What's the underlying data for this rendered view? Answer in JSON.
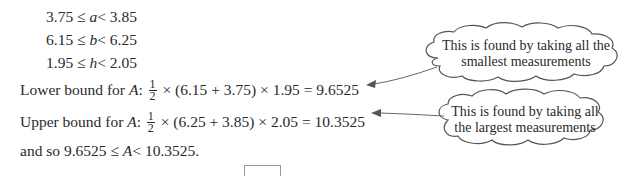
{
  "inequalities": [
    {
      "lower": "3.75",
      "variable": "a",
      "upper": "3.85"
    },
    {
      "lower": "6.15",
      "variable": "b",
      "upper": "6.25"
    },
    {
      "lower": "1.95",
      "variable": "h",
      "upper": "2.05"
    }
  ],
  "symbols": {
    "le": "≤",
    "lt": "<",
    "times": "×"
  },
  "lower_bound": {
    "label": "Lower bound for ",
    "var": "A",
    "colon": ":",
    "frac_num": "1",
    "frac_den": "2",
    "expression": "(6.15 + 3.75)",
    "factor": "1.95",
    "result": "= 9.6525"
  },
  "upper_bound": {
    "label": "Upper bound for ",
    "var": "A",
    "colon": ":",
    "frac_num": "1",
    "frac_den": "2",
    "expression": "(6.25 + 3.85)",
    "factor": "2.05",
    "result": "= 10.3525"
  },
  "conclusion": {
    "prefix": "and so ",
    "lower": "9.6525",
    "var": "A",
    "upper": "10.3525."
  },
  "callouts": [
    {
      "line1": "This is found by taking all the",
      "line2": "smallest measurements"
    },
    {
      "line1": "This is found by taking all",
      "line2": "the largest measurements"
    }
  ]
}
